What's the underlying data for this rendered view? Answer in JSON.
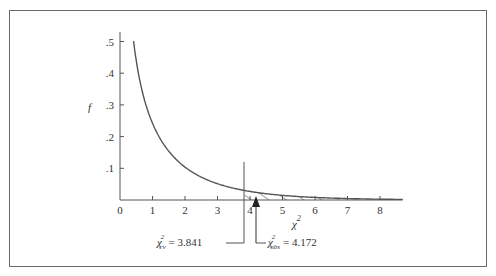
{
  "chart_data": {
    "type": "line",
    "title": "",
    "xlabel": "χ²",
    "ylabel": "f",
    "xlim": [
      0,
      8.7
    ],
    "ylim": [
      0,
      0.5
    ],
    "grid": false,
    "legend": null,
    "x_ticks": [
      "0",
      "1",
      "2",
      "3",
      "4",
      "5",
      "6",
      "7",
      "8"
    ],
    "y_ticks": [
      ".1",
      ".2",
      ".3",
      ".4",
      ".5"
    ],
    "series": [
      {
        "name": "chi-square density (df = 1)",
        "x": [
          0.4,
          0.5,
          0.6,
          0.8,
          1.0,
          1.25,
          1.5,
          2.0,
          2.5,
          3.0,
          3.5,
          3.841,
          4.0,
          4.5,
          5.0,
          5.5,
          6.0,
          6.5,
          7.0,
          7.5,
          8.0,
          8.7
        ],
        "values": [
          0.516,
          0.439,
          0.395,
          0.331,
          0.242,
          0.191,
          0.154,
          0.104,
          0.072,
          0.051,
          0.037,
          0.03,
          0.027,
          0.02,
          0.015,
          0.011,
          0.008,
          0.006,
          0.004,
          0.003,
          0.002,
          0.002
        ]
      }
    ],
    "shaded_region": {
      "from": 3.841,
      "to": 8.7,
      "style": "hatched"
    },
    "annotations": [
      {
        "label_sub": "cv",
        "text": "= 3.841",
        "x": 3.841,
        "marker": "vertical line"
      },
      {
        "label_sub": "obs",
        "text": "= 4.172",
        "x": 4.172,
        "marker": "arrow"
      }
    ]
  },
  "labels": {
    "x_axis": "χ",
    "x_axis_sup": "2",
    "y_axis": "f",
    "cv_symbol": "χ",
    "cv_sup": "2",
    "cv_sub": "cv",
    "cv_value": "= 3.841",
    "obs_symbol": "χ",
    "obs_sup": "2",
    "obs_sub": "obs",
    "obs_value": "= 4.172"
  }
}
